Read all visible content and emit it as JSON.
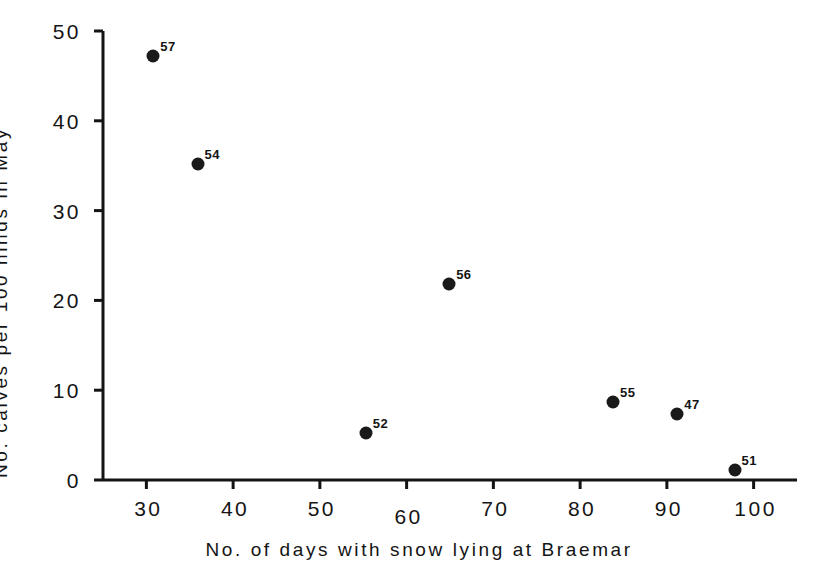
{
  "chart_data": {
    "type": "scatter",
    "title": "",
    "xlabel": "No. of days with snow lying at Braemar",
    "ylabel": "No. calves per 100 hinds in May",
    "xlim": [
      25,
      105
    ],
    "ylim": [
      0,
      50
    ],
    "xticks": [
      30,
      40,
      50,
      60,
      70,
      80,
      90,
      100
    ],
    "xtick_labels": [
      "30",
      "40",
      "50",
      "60",
      "70",
      "80",
      "90",
      "100"
    ],
    "yticks": [
      0,
      10,
      20,
      30,
      40,
      50
    ],
    "ytick_labels": [
      "0",
      "10",
      "20",
      "30",
      "40",
      "50"
    ],
    "grid": false,
    "legend": "none",
    "point_label_position": "upper-right",
    "points": [
      {
        "label": "57",
        "x": 30.8,
        "y": 47.2
      },
      {
        "label": "54",
        "x": 35.9,
        "y": 35.2
      },
      {
        "label": "56",
        "x": 64.9,
        "y": 21.8
      },
      {
        "label": "52",
        "x": 55.3,
        "y": 5.2
      },
      {
        "label": "55",
        "x": 83.8,
        "y": 8.7
      },
      {
        "label": "47",
        "x": 91.2,
        "y": 7.3
      },
      {
        "label": "51",
        "x": 97.8,
        "y": 1.1
      }
    ]
  },
  "colors": {
    "marker": "#1a1a1a",
    "axis": "#141414",
    "background": "#ffffff"
  }
}
